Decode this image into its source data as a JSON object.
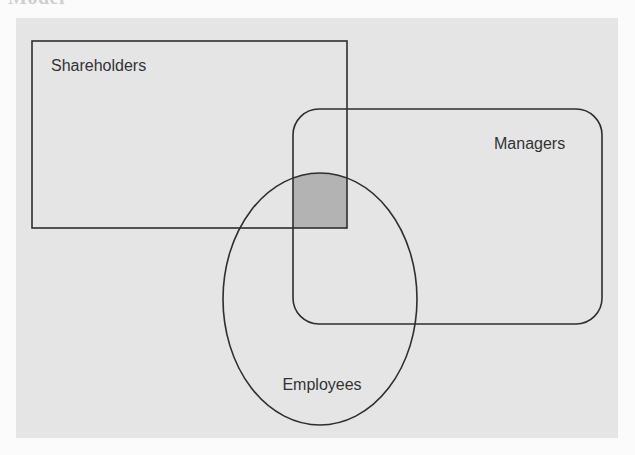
{
  "page": {
    "clipped_heading": "Model"
  },
  "diagram": {
    "colors": {
      "page_background": "#fbfbfb",
      "panel_background": "#e5e5e5",
      "stroke": "#2e2e2e",
      "intersection_fill": "#b3b3b3",
      "label_text": "#333333"
    },
    "sets": [
      {
        "id": "shareholders",
        "label": "Shareholders",
        "shape": "rectangle"
      },
      {
        "id": "managers",
        "label": "Managers",
        "shape": "rounded-rectangle"
      },
      {
        "id": "employees",
        "label": "Employees",
        "shape": "ellipse"
      }
    ],
    "highlighted_region": {
      "description": "Intersection of Shareholders, Managers and Employees",
      "members": [
        "Shareholders",
        "Managers",
        "Employees"
      ]
    }
  }
}
